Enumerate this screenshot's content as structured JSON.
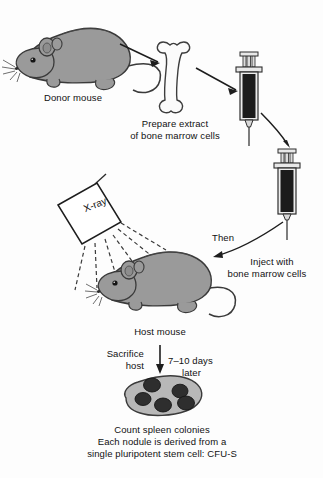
{
  "figure": {
    "background_color": "#fdfdfd",
    "line_color": "#222222",
    "mouse_fill": "#9a9a9a",
    "mouse_outline": "#3a3a3a",
    "bone_fill": "#fbfbfb",
    "syringe_barrel_fill": "#1c1c1c",
    "spleen_fill": "#b8b8b8",
    "nodule_fill": "#2e2e2e"
  },
  "labels": {
    "donor_mouse": "Donor mouse",
    "prepare_extract_line1": "Prepare extract",
    "prepare_extract_line2": "of bone marrow cells",
    "xray": "X-ray",
    "then": "Then",
    "inject_line1": "Inject with",
    "inject_line2": "bone marrow cells",
    "host_mouse": "Host mouse",
    "sacrifice_line1": "Sacrifice",
    "sacrifice_line2": "host",
    "days_line1": "7–10 days",
    "days_line2": "later",
    "caption_line1": "Count spleen colonies",
    "caption_line2": "Each nodule is derived from a",
    "caption_line3": "single pluripotent stem cell: CFU-S"
  },
  "elements": {
    "donor_mouse_icon": "mouse-icon",
    "bone_icon": "bone-icon",
    "syringe_top_icon": "syringe-icon",
    "syringe_bottom_icon": "syringe-icon",
    "xray_source_icon": "xray-emitter-icon",
    "host_mouse_icon": "mouse-icon",
    "spleen_icon": "spleen-icon",
    "arrow_mouse_to_bone": "arrow-icon",
    "arrow_bone_to_syringe": "arrow-icon",
    "arrow_syringe_to_syringe": "curved-arrow-icon",
    "arrow_syringe_to_host": "curved-arrow-icon",
    "arrow_host_to_spleen": "arrow-icon"
  },
  "spleen": {
    "nodule_count": 5,
    "nodules": [
      {
        "cx": 152,
        "cy": 385,
        "rx": 8.5,
        "ry": 7.0
      },
      {
        "cx": 180,
        "cy": 391,
        "rx": 8.0,
        "ry": 6.8
      },
      {
        "cx": 143,
        "cy": 399,
        "rx": 8.0,
        "ry": 6.5
      },
      {
        "cx": 163,
        "cy": 405,
        "rx": 8.5,
        "ry": 7.0
      },
      {
        "cx": 186,
        "cy": 403,
        "rx": 8.5,
        "ry": 7.0
      }
    ]
  },
  "xray_beams": {
    "count": 6,
    "dash_pattern": "4 3"
  }
}
